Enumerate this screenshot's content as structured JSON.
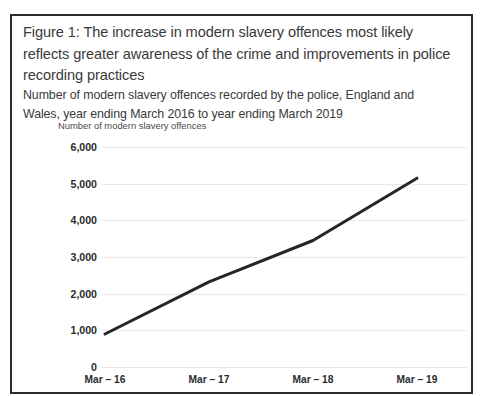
{
  "figure": {
    "title": "Figure 1: The increase in modern slavery offences most likely reflects greater awareness of the crime and improvements in police recording practices",
    "subtitle": "Number of modern slavery offences recorded by the police, England and Wales, year ending March 2016 to year ending March 2019"
  },
  "colors": {
    "frame_border": "#2b2b2b",
    "line": "#262626",
    "gridline": "#e9e9e9",
    "title_text": "#3a3a3a",
    "tick_text": "#2b2b2b",
    "background": "#ffffff"
  },
  "chart_data": {
    "type": "line",
    "title": "Figure 1: The increase in modern slavery offences most likely reflects greater awareness of the crime and improvements in police recording practices",
    "subtitle": "Number of modern slavery offences recorded by the police, England and Wales, year ending March 2016 to year ending March 2019",
    "xlabel": "",
    "ylabel": "Number of modern slavery offences",
    "categories": [
      "Mar – 16",
      "Mar – 17",
      "Mar – 18",
      "Mar – 19"
    ],
    "values": [
      900,
      2320,
      3450,
      5150
    ],
    "series": [
      {
        "name": "Number of modern slavery offences",
        "values": [
          900,
          2320,
          3450,
          5150
        ]
      }
    ],
    "ylim": [
      0,
      6000
    ],
    "y_ticks": [
      0,
      1000,
      2000,
      3000,
      4000,
      5000,
      6000
    ],
    "y_tick_labels": [
      "0",
      "1,000",
      "2,000",
      "3,000",
      "4,000",
      "5,000",
      "6,000"
    ],
    "x_tick_labels": [
      "Mar – 16",
      "Mar – 17",
      "Mar – 18",
      "Mar – 19"
    ],
    "grid": true,
    "legend": false,
    "markers": false,
    "line_width": 3
  }
}
